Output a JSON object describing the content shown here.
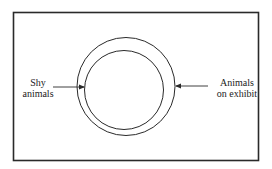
{
  "diagram": {
    "labels": {
      "shy_animals": {
        "line1": "Shy",
        "line2": "animals"
      },
      "animals_on_exhibit": {
        "line1": "Animals",
        "line2": "on exhibit"
      }
    },
    "colors": {
      "stroke": "#2a2a2a",
      "background": "#ffffff"
    }
  }
}
